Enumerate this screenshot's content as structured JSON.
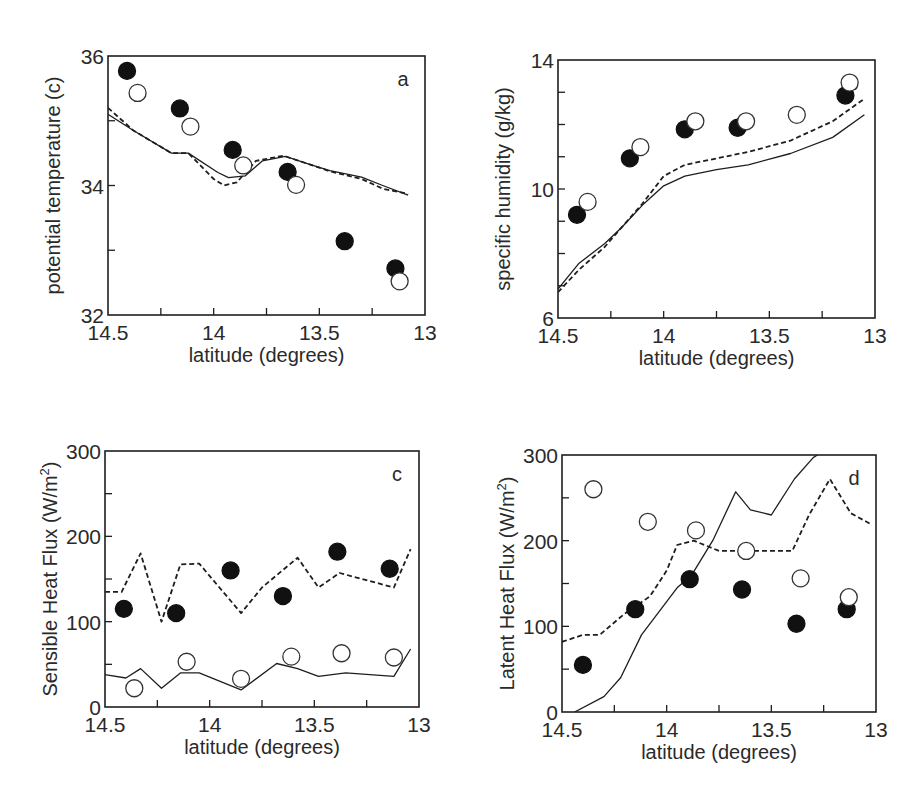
{
  "figure": {
    "background": "#ffffff",
    "ink": "#1e1e1e"
  },
  "chart_data": [
    {
      "id": "a",
      "type": "scatter",
      "panel_label": "a",
      "title": "",
      "xlabel": "latitude (degrees)",
      "ylabel": "potential temperature (c)",
      "xlim": [
        14.5,
        13
      ],
      "ylim": [
        32,
        36
      ],
      "xticks": [
        14.5,
        14,
        13.5,
        13
      ],
      "xtick_labels": [
        "14.5",
        "14",
        "13.5",
        "13"
      ],
      "xminor": [
        14.25,
        13.75,
        13.25
      ],
      "yticks": [
        32,
        34,
        36
      ],
      "ytick_labels": [
        "32",
        "34",
        "36"
      ],
      "yminor": [
        33,
        35
      ],
      "grid": false,
      "box": {
        "left": 108,
        "right": 425,
        "top": 56,
        "bottom": 315
      },
      "series": [
        {
          "name": "observed (filled)",
          "style": "filled-circle",
          "x": [
            14.41,
            14.16,
            13.91,
            13.65,
            13.38,
            13.14
          ],
          "y": [
            35.77,
            35.19,
            34.55,
            34.21,
            33.14,
            32.72
          ]
        },
        {
          "name": "observed (open)",
          "style": "open-circle",
          "x": [
            14.36,
            14.11,
            13.86,
            13.61,
            13.12
          ],
          "y": [
            35.43,
            34.91,
            34.31,
            34.01,
            32.52
          ]
        },
        {
          "name": "model (solid)",
          "style": "solid-line",
          "x": [
            14.5,
            14.38,
            14.2,
            14.12,
            13.98,
            13.93,
            13.85,
            13.77,
            13.66,
            13.55,
            13.45,
            13.3,
            13.2,
            13.08
          ],
          "y": [
            35.1,
            34.85,
            34.5,
            34.5,
            34.2,
            34.12,
            34.15,
            34.38,
            34.45,
            34.33,
            34.23,
            34.13,
            34.0,
            33.85
          ]
        },
        {
          "name": "model (dashed)",
          "style": "dashed-line",
          "x": [
            14.5,
            14.38,
            14.2,
            14.12,
            14.0,
            13.95,
            13.89,
            13.8,
            13.67,
            13.55,
            13.45,
            13.3,
            13.2,
            13.08
          ],
          "y": [
            35.2,
            34.85,
            34.5,
            34.5,
            34.1,
            34.0,
            34.05,
            34.38,
            34.46,
            34.33,
            34.22,
            34.1,
            33.95,
            33.87
          ]
        }
      ]
    },
    {
      "id": "b",
      "type": "scatter",
      "panel_label": "b",
      "title": "",
      "xlabel": "latitude (degrees)",
      "ylabel": "specific humidity (g/kg)",
      "xlim": [
        14.5,
        13
      ],
      "ylim": [
        6,
        14
      ],
      "xticks": [
        14.5,
        14,
        13.5,
        13
      ],
      "xtick_labels": [
        "14.5",
        "14",
        "13.5",
        "13"
      ],
      "xminor": [
        14.25,
        13.75,
        13.25
      ],
      "yticks": [
        6,
        10,
        14
      ],
      "ytick_labels": [
        "6",
        "10",
        "14"
      ],
      "yminor": [
        7,
        8,
        9,
        11,
        12,
        13
      ],
      "grid": false,
      "box": {
        "left": 558,
        "right": 875,
        "top": 60,
        "bottom": 318
      },
      "series": [
        {
          "name": "observed (filled)",
          "style": "filled-circle",
          "x": [
            14.41,
            14.16,
            13.9,
            13.65,
            13.14
          ],
          "y": [
            9.2,
            10.95,
            11.85,
            11.9,
            12.9
          ]
        },
        {
          "name": "observed (open)",
          "style": "open-circle",
          "x": [
            14.36,
            14.11,
            13.85,
            13.61,
            13.37,
            13.12
          ],
          "y": [
            9.6,
            11.3,
            12.1,
            12.1,
            12.3,
            13.3
          ]
        },
        {
          "name": "model (solid)",
          "style": "solid-line",
          "x": [
            14.5,
            14.4,
            14.28,
            14.2,
            14.1,
            14.0,
            13.9,
            13.75,
            13.6,
            13.4,
            13.2,
            13.05
          ],
          "y": [
            6.9,
            7.7,
            8.3,
            8.8,
            9.5,
            10.1,
            10.4,
            10.6,
            10.75,
            11.1,
            11.6,
            12.3
          ]
        },
        {
          "name": "model (dashed)",
          "style": "dashed-line",
          "x": [
            14.5,
            14.4,
            14.28,
            14.2,
            14.1,
            14.0,
            13.9,
            13.75,
            13.6,
            13.4,
            13.2,
            13.05
          ],
          "y": [
            6.8,
            7.5,
            8.2,
            8.8,
            9.55,
            10.4,
            10.75,
            10.95,
            11.15,
            11.5,
            12.1,
            12.8
          ]
        }
      ]
    },
    {
      "id": "c",
      "type": "scatter",
      "panel_label": "c",
      "title": "",
      "xlabel": "latitude (degrees)",
      "ylabel": "Sensible Heat Flux (W/m",
      "ylabel_sup": "2",
      "ylabel_tail": ")",
      "xlim": [
        14.5,
        13
      ],
      "ylim": [
        0,
        300
      ],
      "xticks": [
        14.5,
        14,
        13.5,
        13
      ],
      "xtick_labels": [
        "14.5",
        "14",
        "13.5",
        "13"
      ],
      "xminor": [
        14.25,
        13.75,
        13.25
      ],
      "yticks": [
        0,
        100,
        200,
        300
      ],
      "ytick_labels": [
        "0",
        "100",
        "200",
        "300"
      ],
      "yminor": [
        50,
        150,
        250
      ],
      "grid": false,
      "box": {
        "left": 105,
        "right": 419,
        "top": 451,
        "bottom": 707
      },
      "series": [
        {
          "name": "observed (filled)",
          "style": "filled-circle",
          "x": [
            14.41,
            14.16,
            13.9,
            13.65,
            13.39,
            13.14
          ],
          "y": [
            115,
            110,
            160,
            130,
            182,
            162
          ]
        },
        {
          "name": "observed (open)",
          "style": "open-circle",
          "x": [
            14.36,
            14.11,
            13.85,
            13.61,
            13.37,
            13.12
          ],
          "y": [
            22,
            53,
            33,
            59,
            63,
            58
          ]
        },
        {
          "name": "model (solid)",
          "style": "solid-line",
          "x": [
            14.5,
            14.4,
            14.33,
            14.23,
            14.14,
            14.05,
            13.85,
            13.68,
            13.58,
            13.48,
            13.35,
            13.12,
            13.04
          ],
          "y": [
            38,
            34,
            45,
            22,
            40,
            40,
            20,
            51,
            45,
            36,
            40,
            36,
            68
          ]
        },
        {
          "name": "model (dashed)",
          "style": "dashed-line",
          "x": [
            14.5,
            14.42,
            14.33,
            14.23,
            14.14,
            14.05,
            13.85,
            13.75,
            13.58,
            13.48,
            13.38,
            13.12,
            13.04
          ],
          "y": [
            135,
            135,
            180,
            100,
            167,
            168,
            110,
            140,
            175,
            140,
            157,
            140,
            185
          ]
        }
      ]
    },
    {
      "id": "d",
      "type": "scatter",
      "panel_label": "d",
      "title": "",
      "xlabel": "latitude (degrees)",
      "ylabel": "Latent Heat Flux (W/m",
      "ylabel_sup": "2",
      "ylabel_tail": ")",
      "xlim": [
        14.5,
        13
      ],
      "ylim": [
        0,
        300
      ],
      "xticks": [
        14.5,
        14,
        13.5,
        13
      ],
      "xtick_labels": [
        "14.5",
        "14",
        "13.5",
        "13"
      ],
      "xminor": [
        14.25,
        13.75,
        13.25
      ],
      "yticks": [
        0,
        100,
        200,
        300
      ],
      "ytick_labels": [
        "0",
        "100",
        "200",
        "300"
      ],
      "yminor": [
        50,
        150,
        250
      ],
      "grid": false,
      "box": {
        "left": 562,
        "right": 876,
        "top": 455,
        "bottom": 712
      },
      "series": [
        {
          "name": "observed (filled)",
          "style": "filled-circle",
          "x": [
            14.4,
            14.15,
            13.89,
            13.64,
            13.38,
            13.14
          ],
          "y": [
            55,
            120,
            155,
            143,
            103,
            120
          ]
        },
        {
          "name": "observed (open)",
          "style": "open-circle",
          "x": [
            14.35,
            14.09,
            13.86,
            13.62,
            13.36,
            13.13
          ],
          "y": [
            260,
            222,
            212,
            188,
            156,
            134
          ]
        },
        {
          "name": "model (solid)",
          "style": "solid-line",
          "x": [
            14.44,
            14.3,
            14.22,
            14.12,
            13.95,
            13.88,
            13.78,
            13.67,
            13.6,
            13.5,
            13.39,
            13.3,
            13.28
          ],
          "y": [
            0,
            18,
            40,
            90,
            145,
            160,
            200,
            257,
            236,
            230,
            272,
            297,
            300
          ]
        },
        {
          "name": "model (dashed)",
          "style": "dashed-line",
          "x": [
            14.5,
            14.4,
            14.32,
            14.2,
            14.08,
            14.0,
            13.95,
            13.87,
            13.75,
            13.6,
            13.4,
            13.32,
            13.22,
            13.12,
            13.03
          ],
          "y": [
            82,
            90,
            90,
            115,
            135,
            165,
            195,
            200,
            188,
            188,
            188,
            230,
            272,
            232,
            220
          ]
        }
      ]
    }
  ]
}
